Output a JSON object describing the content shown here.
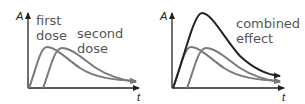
{
  "panels": [
    {
      "axis_y": "A",
      "axis_x": "t",
      "labels": [
        {
          "line1": "first",
          "line2": "dose"
        },
        {
          "line1": "second",
          "line2": "dose"
        }
      ]
    },
    {
      "axis_y": "A",
      "axis_x": "t",
      "labels": [
        {
          "line1": "combined",
          "line2": "effect"
        }
      ]
    }
  ],
  "colors": {
    "dose_curve": "#7a7a7a",
    "combined_curve": "#222222",
    "axis": "#222222",
    "label_text": "#555555"
  }
}
